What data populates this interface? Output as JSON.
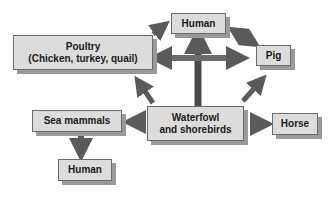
{
  "nodes": {
    "poultry": {
      "line1": "Poultry",
      "line2": "(Chicken, turkey, quail)"
    },
    "human_top": {
      "label": "Human"
    },
    "pig": {
      "label": "Pig"
    },
    "waterfowl": {
      "line1": "Waterfowl",
      "line2": "and shorebirds"
    },
    "sea_mammals": {
      "label": "Sea mammals"
    },
    "horse": {
      "label": "Horse"
    },
    "human_bottom": {
      "label": "Human"
    }
  },
  "edges": [
    {
      "from": "waterfowl",
      "to": "human_top"
    },
    {
      "from": "waterfowl",
      "to": "poultry"
    },
    {
      "from": "waterfowl",
      "to": "pig"
    },
    {
      "from": "waterfowl",
      "to": "sea_mammals"
    },
    {
      "from": "waterfowl",
      "to": "horse"
    },
    {
      "from": "poultry",
      "to": "human_top"
    },
    {
      "between": [
        "poultry",
        "pig"
      ]
    },
    {
      "between": [
        "human_top",
        "pig"
      ]
    },
    {
      "from": "sea_mammals",
      "to": "human_bottom"
    }
  ],
  "colors": {
    "box_fill": "#dcdcdc",
    "box_border": "#6a6a6a",
    "shadow": "#9a9a9a",
    "arrow": "#5a5a5a"
  }
}
